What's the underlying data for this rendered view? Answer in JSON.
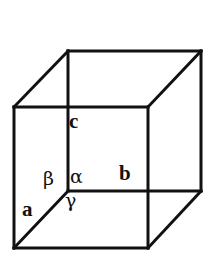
{
  "figure": {
    "name": "unit-cell-cube-diagram",
    "background_color": "#ffffff",
    "stroke_color": "#111111",
    "text_color": "#111111"
  },
  "labels": {
    "axis_a": "a",
    "axis_b": "b",
    "axis_c": "c",
    "angle_alpha": "α",
    "angle_beta": "β",
    "angle_gamma": "γ"
  },
  "geometry": {
    "canvas": {
      "width": 212,
      "height": 266
    },
    "front_face": {
      "top_left": [
        14,
        107
      ],
      "top_right": [
        148,
        107
      ],
      "bottom_right": [
        148,
        248
      ],
      "bottom_left": [
        14,
        248
      ]
    },
    "back_face": {
      "top_left": [
        68,
        51
      ],
      "top_right": [
        201,
        51
      ],
      "bottom_right": [
        201,
        191
      ],
      "bottom_left": [
        68,
        191
      ]
    },
    "stroke_width": 3
  }
}
